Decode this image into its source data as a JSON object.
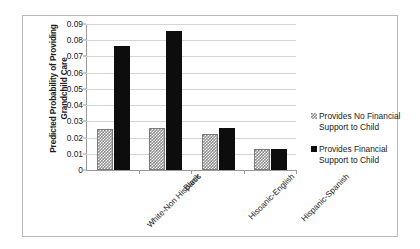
{
  "chart_data": {
    "type": "bar",
    "title": "",
    "xlabel": "",
    "ylabel": "Predicted Probability of Providing Grandchild Care",
    "categories": [
      "White-Non Hispanic",
      "Black",
      "Hisoanic-English",
      "Hispanic-Spanish"
    ],
    "series": [
      {
        "name": "Provides No Financial Support to Child",
        "values": [
          0.025,
          0.026,
          0.022,
          0.0132
        ]
      },
      {
        "name": "Provides  Financial Support to Child",
        "values": [
          0.0765,
          0.0855,
          0.026,
          0.0128
        ]
      }
    ],
    "ylim": [
      0,
      0.09
    ],
    "ytick_labels": [
      "0.09",
      "0.08",
      "0.07",
      "0.06",
      "0.05",
      "0.04",
      "0.03",
      "0.02",
      "0.01",
      "0"
    ],
    "ytick_values": [
      0.09,
      0.08,
      0.07,
      0.06,
      0.05,
      0.04,
      0.03,
      0.02,
      0.01,
      0
    ],
    "grid": true,
    "legend_position": "right",
    "colors": {
      "no_support": "#8d8d8d",
      "support": "#0d0d0d",
      "gridline": "#d4d4d4",
      "axis": "#9a9a9a",
      "frame": "#b9b9b9",
      "text": "#1a1a1a"
    }
  },
  "legend": {
    "items": [
      {
        "label_line1": "Provides No Financial",
        "label_line2": "Support to Child",
        "swatch": "hatched-square-icon"
      },
      {
        "label_line1": "Provides  Financial",
        "label_line2": "Support to Child",
        "swatch": "solid-square-icon"
      }
    ]
  }
}
